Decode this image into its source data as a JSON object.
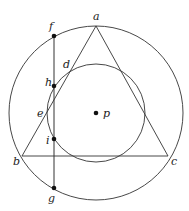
{
  "diagram": {
    "outer_circle": {
      "cx": 96,
      "cy": 113,
      "r": 87
    },
    "inner_circle": {
      "cx": 96,
      "cy": 113,
      "r": 49
    },
    "triangle": {
      "a": [
        96,
        26
      ],
      "b": [
        22,
        156
      ],
      "c": [
        168,
        156
      ]
    },
    "chord": {
      "x": 54,
      "y1": 36,
      "y2": 188
    },
    "points": {
      "f": {
        "label": "f",
        "x": 54,
        "y": 36
      },
      "h": {
        "label": "h",
        "x": 54,
        "y": 86
      },
      "i": {
        "label": "i",
        "x": 54,
        "y": 139
      },
      "g": {
        "label": "g",
        "x": 54,
        "y": 188
      },
      "p": {
        "label": "p",
        "x": 96,
        "y": 113
      }
    },
    "labels": {
      "a": "a",
      "b": "b",
      "c": "c",
      "d": "d",
      "e": "e",
      "f": "f",
      "g": "g",
      "h": "h",
      "i": "i",
      "p": "p"
    }
  }
}
